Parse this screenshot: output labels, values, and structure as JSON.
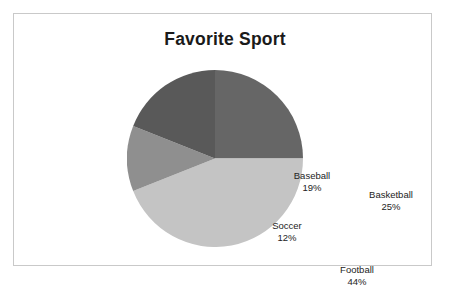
{
  "chart_data": {
    "type": "pie",
    "title": "Favorite Sport",
    "xlabel": "",
    "ylabel": "",
    "legend_position": "none",
    "grid": false,
    "labels_inside_slices": true,
    "start_angle_deg": 0,
    "direction": "clockwise",
    "categories": [
      "Basketball",
      "Football",
      "Soccer",
      "Baseball"
    ],
    "values": [
      25,
      44,
      12,
      19
    ],
    "value_unit": "%",
    "slices": [
      {
        "label": "Basketball",
        "value": 25,
        "value_text": "25%",
        "color": "#666666"
      },
      {
        "label": "Football",
        "value": 44,
        "value_text": "44%",
        "color": "#c4c4c4"
      },
      {
        "label": "Soccer",
        "value": 12,
        "value_text": "12%",
        "color": "#8f8f8f"
      },
      {
        "label": "Baseball",
        "value": 19,
        "value_text": "19%",
        "color": "#595959"
      }
    ]
  },
  "frame": {
    "border_color": "#c9c9c9",
    "background": "#ffffff"
  }
}
